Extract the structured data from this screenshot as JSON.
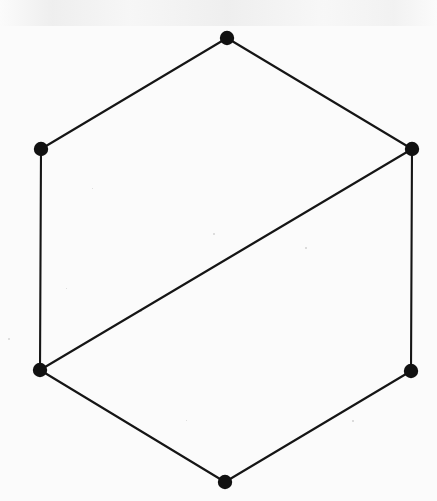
{
  "figure": {
    "canvas": {
      "width": 437,
      "height": 501
    },
    "colors": {
      "background": "#fbfbfb",
      "ink": "#151515",
      "vertex_fill": "#111111"
    },
    "style": {
      "edge_width": 2.1,
      "vertex_radius": 7.2
    }
  },
  "chart_data": {
    "type": "scatter",
    "title": "",
    "xlabel": "",
    "ylabel": "",
    "grid": false,
    "legend": "none",
    "xlim": [
      0,
      437
    ],
    "ylim": [
      0,
      501
    ],
    "nodes": [
      {
        "id": "v1",
        "label": "top",
        "x": 227,
        "y": 38,
        "degree": 2
      },
      {
        "id": "v2",
        "label": "upper-right",
        "x": 412,
        "y": 149,
        "degree": 3
      },
      {
        "id": "v3",
        "label": "lower-right",
        "x": 411,
        "y": 371,
        "degree": 2
      },
      {
        "id": "v4",
        "label": "bottom",
        "x": 225,
        "y": 482,
        "degree": 2
      },
      {
        "id": "v5",
        "label": "lower-left",
        "x": 40,
        "y": 370,
        "degree": 3
      },
      {
        "id": "v6",
        "label": "upper-left",
        "x": 41,
        "y": 149,
        "degree": 2
      }
    ],
    "edges": [
      {
        "id": "e1",
        "from": "v6",
        "to": "v1",
        "kind": "perimeter"
      },
      {
        "id": "e2",
        "from": "v1",
        "to": "v2",
        "kind": "perimeter"
      },
      {
        "id": "e3",
        "from": "v2",
        "to": "v3",
        "kind": "perimeter"
      },
      {
        "id": "e4",
        "from": "v3",
        "to": "v4",
        "kind": "perimeter"
      },
      {
        "id": "e5",
        "from": "v4",
        "to": "v5",
        "kind": "perimeter"
      },
      {
        "id": "e6",
        "from": "v5",
        "to": "v6",
        "kind": "perimeter"
      },
      {
        "id": "e7",
        "from": "v5",
        "to": "v2",
        "kind": "chord"
      }
    ],
    "node_count": 6,
    "edge_count": 7
  },
  "specks": [
    {
      "x": 8,
      "y": 338,
      "size": 2.2
    },
    {
      "x": 213,
      "y": 233,
      "size": 1.8
    },
    {
      "x": 305,
      "y": 247,
      "size": 1.6
    },
    {
      "x": 140,
      "y": 310,
      "size": 1.5
    },
    {
      "x": 66,
      "y": 288,
      "size": 1.4
    },
    {
      "x": 352,
      "y": 420,
      "size": 1.5
    },
    {
      "x": 186,
      "y": 420,
      "size": 1.4
    },
    {
      "x": 92,
      "y": 188,
      "size": 1.3
    }
  ]
}
